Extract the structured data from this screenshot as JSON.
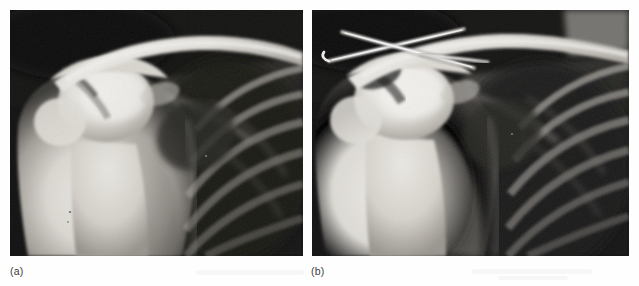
{
  "figure": {
    "kind": "radiograph-pair",
    "background_color": "#fefefe",
    "panels": [
      {
        "id": "a",
        "caption": "(a)",
        "modality": "X-ray radiograph",
        "anatomy": "right shoulder, anteroposterior view",
        "finding": "displaced mid-shaft clavicle fracture, no fixation hardware",
        "hardware": "none",
        "film_background_color": "#111111",
        "bone_highlight_color": "#f2f0ec"
      },
      {
        "id": "b",
        "caption": "(b)",
        "modality": "X-ray radiograph",
        "anatomy": "right shoulder, anteroposterior view",
        "finding": "clavicle fracture after fixation with two crossed Kirschner wires",
        "hardware": "two crossed K-wires (pins)",
        "film_background_color": "#121212",
        "bone_highlight_color": "#f4f2ee",
        "pin_color": "#fbfaf7"
      }
    ]
  }
}
